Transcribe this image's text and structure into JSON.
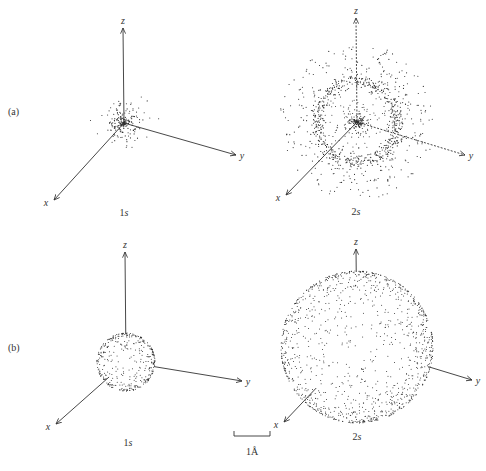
{
  "figure": {
    "rows": [
      {
        "label": "(a)",
        "description": "probability density dot plots"
      },
      {
        "label": "(b)",
        "description": "boundary surface spheres"
      }
    ],
    "axis_labels": {
      "x": "x",
      "y": "y",
      "z": "z"
    },
    "scale_bar": {
      "label": "1Å",
      "length_px": 36
    },
    "colors": {
      "ink": "#333333",
      "background": "#ffffff"
    }
  },
  "panels": [
    {
      "id": "a-1s",
      "row": "(a)",
      "orbital": "1s",
      "orbital_num": "1",
      "orbital_letter": "s",
      "origin": [
        124,
        123
      ],
      "z_end": [
        123,
        28
      ],
      "y_end": [
        236,
        155
      ],
      "x_end": [
        54,
        200
      ],
      "caption_pos": [
        124,
        216
      ],
      "cloud": {
        "type": "density",
        "core_r": 24,
        "ring_r": 0,
        "outer_r": 0,
        "n_core": 220
      }
    },
    {
      "id": "a-2s",
      "row": "(a)",
      "orbital": "2s",
      "orbital_num": "2",
      "orbital_letter": "s",
      "origin": [
        357,
        122
      ],
      "z_end": [
        356,
        18
      ],
      "y_end": [
        465,
        155
      ],
      "x_end": [
        286,
        195
      ],
      "caption_pos": [
        356,
        215
      ],
      "cloud": {
        "type": "density",
        "core_r": 12,
        "ring_r": 40,
        "outer_r": 78,
        "n_core": 160,
        "n_ring": 650,
        "n_outer": 260
      }
    },
    {
      "id": "b-1s",
      "row": "(b)",
      "orbital": "1s",
      "orbital_num": "1",
      "orbital_letter": "s",
      "origin": [
        126,
        362
      ],
      "z_end": [
        125,
        252
      ],
      "y_end": [
        242,
        381
      ],
      "x_end": [
        56,
        424
      ],
      "caption_pos": [
        128,
        446
      ],
      "cloud": {
        "type": "sphere",
        "center": [
          126,
          362
        ],
        "r": 29,
        "n": 480
      }
    },
    {
      "id": "b-2s",
      "row": "(b)",
      "orbital": "2s",
      "orbital_num": "2",
      "orbital_letter": "s",
      "origin": [
        357,
        345
      ],
      "z_end": [
        356,
        249
      ],
      "y_end": [
        472,
        380
      ],
      "x_end": [
        284,
        422
      ],
      "caption_pos": [
        357,
        440
      ],
      "cloud": {
        "type": "sphere",
        "center": [
          357,
          347
        ],
        "r": 76,
        "n": 1500
      }
    }
  ]
}
